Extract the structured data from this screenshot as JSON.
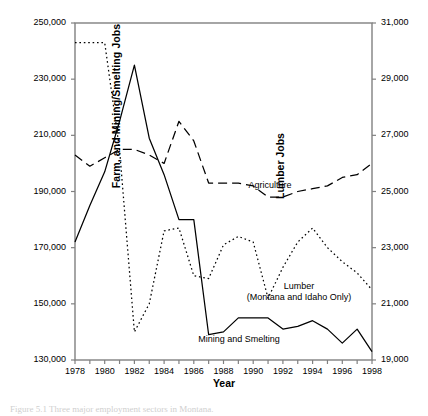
{
  "figure": {
    "xlabel": "Year",
    "ylabel_left": "Farm, and Mining/Smelting Jobs",
    "ylabel_right": "Lumber Jobs",
    "caption": "Figure 5.1  Three major employment sectors in Montana.",
    "left_ticks": [
      "130,000",
      "150,000",
      "170,000",
      "190,000",
      "210,000",
      "230,000",
      "250,000"
    ],
    "right_ticks": [
      "19,000",
      "21,000",
      "23,000",
      "25,000",
      "27,000",
      "29,000",
      "31,000"
    ],
    "x_ticks": [
      "1978",
      "1980",
      "1982",
      "1984",
      "1986",
      "1988",
      "1990",
      "1992",
      "1994",
      "1996",
      "1998"
    ],
    "series_labels": {
      "agriculture": "Agriculture",
      "mining": "Mining and Smelting",
      "lumber_line1": "Lumber",
      "lumber_line2": "(Montana and Idaho Only)"
    }
  },
  "chart_data": {
    "type": "line",
    "title": "",
    "xlabel": "Year",
    "ylabel": "Farm, and Mining/Smelting Jobs",
    "ylabel_secondary": "Lumber Jobs",
    "grid": false,
    "legend": "inline-annotations",
    "xlim": [
      1978,
      1998
    ],
    "ylim_left": [
      130000,
      250000
    ],
    "ylim_right": [
      19000,
      31000
    ],
    "x": [
      1978,
      1979,
      1980,
      1981,
      1982,
      1983,
      1984,
      1985,
      1986,
      1987,
      1988,
      1989,
      1990,
      1991,
      1992,
      1993,
      1994,
      1995,
      1996,
      1997,
      1998
    ],
    "series": [
      {
        "name": "Mining and Smelting",
        "axis": "left",
        "style": "solid",
        "values": [
          172000,
          185000,
          197000,
          215000,
          235000,
          209000,
          196000,
          180000,
          180000,
          139000,
          140000,
          145000,
          145000,
          145000,
          141000,
          142000,
          144000,
          141000,
          136000,
          141000,
          133000
        ]
      },
      {
        "name": "Agriculture",
        "axis": "left",
        "style": "long-dash",
        "values": [
          203000,
          199000,
          202000,
          205000,
          205000,
          203000,
          200000,
          215000,
          208000,
          193000,
          193000,
          193000,
          192000,
          188000,
          188000,
          190000,
          191000,
          192000,
          195000,
          196000,
          200000
        ]
      },
      {
        "name": "Lumber (Montana and Idaho Only)",
        "axis": "right",
        "style": "dotted",
        "values": [
          30300,
          30300,
          30300,
          26500,
          20000,
          21000,
          23600,
          23700,
          22000,
          21900,
          23100,
          23400,
          23200,
          21200,
          22300,
          23200,
          23700,
          23000,
          22500,
          22100,
          21500
        ]
      }
    ]
  }
}
